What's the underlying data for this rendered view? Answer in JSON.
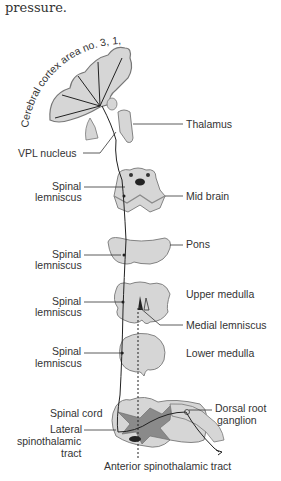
{
  "intro_text": "pressure.",
  "labels": {
    "cortex": "Cerebral cortex area no. 3, 1, 2",
    "thalamus": "Thalamus",
    "vpl_nucleus": "VPL nucleus",
    "spinal_lemniscus_1_a": "Spinal",
    "spinal_lemniscus_1_b": "lemniscus",
    "mid_brain": "Mid brain",
    "spinal_lemniscus_2_a": "Spinal",
    "spinal_lemniscus_2_b": "lemniscus",
    "pons": "Pons",
    "spinal_lemniscus_3_a": "Spinal",
    "spinal_lemniscus_3_b": "lemniscus",
    "upper_medulla": "Upper medulla",
    "medial_lemniscus": "Medial lemniscus",
    "spinal_lemniscus_4_a": "Spinal",
    "spinal_lemniscus_4_b": "lemniscus",
    "lower_medulla": "Lower medulla",
    "spinal_cord": "Spinal cord",
    "lateral_st_a": "Lateral",
    "lateral_st_b": "spinothalamic",
    "lateral_st_c": "tract",
    "dorsal_root_a": "Dorsal root",
    "dorsal_root_b": "ganglion",
    "anterior_st": "Anterior spinothalamic tract"
  },
  "colors": {
    "tissue_fill": "#d6d6d6",
    "tissue_dark": "#8a8a8a",
    "outline": "#555555",
    "line": "#222222",
    "text": "#333333"
  }
}
